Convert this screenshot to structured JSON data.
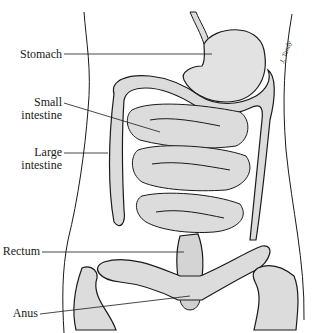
{
  "diagram": {
    "labels": [
      {
        "id": "stomach",
        "text": "Stomach"
      },
      {
        "id": "small-intestine",
        "line1": "Small",
        "line2": "intestine"
      },
      {
        "id": "large-intestine",
        "line1": "Large",
        "line2": "intestine"
      },
      {
        "id": "rectum",
        "text": "Rectum"
      },
      {
        "id": "anus",
        "text": "Anus"
      }
    ],
    "signature": "J. Tandy",
    "colors": {
      "organ_fill": "#dcdcdc",
      "outline": "#1a1a1a",
      "background": "#ffffff"
    }
  }
}
